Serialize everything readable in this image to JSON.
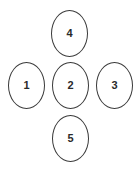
{
  "diagram": {
    "layout": "cross",
    "stroke_color": "#3a3a3a",
    "label_color": "#2a2a2a",
    "background": "#ffffff",
    "nodes": [
      {
        "id": "node-1",
        "label": "1",
        "position": "left"
      },
      {
        "id": "node-2",
        "label": "2",
        "position": "center"
      },
      {
        "id": "node-3",
        "label": "3",
        "position": "right"
      },
      {
        "id": "node-4",
        "label": "4",
        "position": "top"
      },
      {
        "id": "node-5",
        "label": "5",
        "position": "bottom"
      }
    ]
  }
}
